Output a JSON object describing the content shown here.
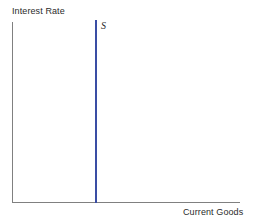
{
  "chart_data": {
    "type": "line",
    "title": "",
    "subtitle": "",
    "xlabel": "Current Goods",
    "ylabel": "Interest Rate",
    "grid": false,
    "legend_position": "none",
    "xlim": [
      0,
      1
    ],
    "ylim": [
      0,
      1
    ],
    "xticks": [],
    "yticks": [],
    "xtick_labels": [],
    "ytick_labels": [],
    "series": [
      {
        "name": "S",
        "label": "S",
        "description": "perfectly inelastic vertical supply of current goods",
        "color": "#3a4da4",
        "orientation": "vertical",
        "x": [
          0.365,
          0.365
        ],
        "y": [
          0.0,
          1.0
        ]
      }
    ],
    "annotations": [
      {
        "text": "S",
        "x": 0.39,
        "y": 1.0,
        "style": "italic-serif"
      }
    ]
  },
  "axes": {
    "y_label": "Interest Rate",
    "x_label": "Current Goods",
    "axis_color": "#808080",
    "text_color": "#2b2b2b"
  },
  "supply": {
    "label": "S",
    "color": "#3a4da4"
  },
  "canvas": {
    "background": "#ffffff",
    "width": "253",
    "height": "224"
  }
}
